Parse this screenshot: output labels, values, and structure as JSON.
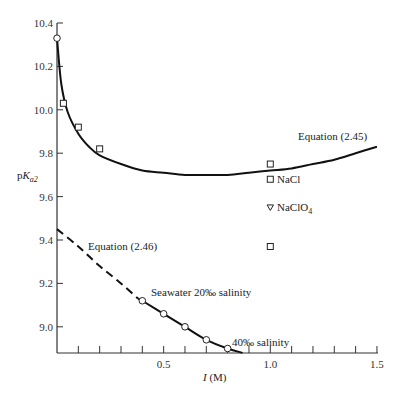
{
  "chart_data": {
    "type": "line",
    "title": "",
    "xlabel": "I (M)",
    "ylabel": "pK_a2",
    "xlim": [
      0,
      1.5
    ],
    "ylim": [
      8.88,
      10.4
    ],
    "grid": false,
    "x_ticks": [
      {
        "value": 0.5,
        "label": "0.5"
      },
      {
        "value": 1.0,
        "label": "1.0"
      },
      {
        "value": 1.5,
        "label": "1.5"
      }
    ],
    "x_minor_tick_step": 0.1,
    "y_ticks": [
      {
        "value": 10.4,
        "label": "10.4"
      },
      {
        "value": 10.2,
        "label": "10.2"
      },
      {
        "value": 10.0,
        "label": "10.0"
      },
      {
        "value": 9.8,
        "label": "9.8"
      },
      {
        "value": 9.6,
        "label": "9.6"
      },
      {
        "value": 9.4,
        "label": "9.4"
      },
      {
        "value": 9.2,
        "label": "9.2"
      },
      {
        "value": 9.0,
        "label": "9.0"
      }
    ],
    "series": [
      {
        "name": "Equation (2.45)",
        "style": "solid",
        "x": [
          0.0,
          0.02,
          0.05,
          0.1,
          0.15,
          0.2,
          0.3,
          0.4,
          0.5,
          0.6,
          0.7,
          0.8,
          0.9,
          1.0,
          1.1,
          1.2,
          1.3,
          1.4,
          1.5
        ],
        "values": [
          10.33,
          10.12,
          9.99,
          9.89,
          9.83,
          9.79,
          9.75,
          9.72,
          9.71,
          9.7,
          9.7,
          9.7,
          9.71,
          9.72,
          9.73,
          9.75,
          9.77,
          9.8,
          9.83
        ]
      },
      {
        "name": "Equation (2.46)",
        "style": "dashed",
        "x": [
          0.0,
          0.1,
          0.2,
          0.3,
          0.38
        ],
        "values": [
          9.45,
          9.37,
          9.28,
          9.2,
          9.13
        ]
      },
      {
        "name": "Seawater fit",
        "style": "solid",
        "x": [
          0.38,
          0.4,
          0.5,
          0.6,
          0.7,
          0.8,
          0.87
        ],
        "values": [
          9.13,
          9.12,
          9.06,
          9.0,
          8.94,
          8.9,
          8.88
        ]
      }
    ],
    "markers": [
      {
        "group": "open-circle",
        "points": [
          [
            0.0,
            10.33
          ]
        ]
      },
      {
        "group": "open-square",
        "points": [
          [
            0.03,
            10.03
          ],
          [
            0.1,
            9.92
          ],
          [
            0.2,
            9.82
          ],
          [
            1.0,
            9.75
          ],
          [
            1.0,
            9.68
          ],
          [
            1.0,
            9.37
          ]
        ]
      },
      {
        "group": "open-triangle-down",
        "points": [
          [
            1.0,
            9.55
          ]
        ]
      },
      {
        "group": "seawater-circle",
        "points": [
          [
            0.4,
            9.12
          ],
          [
            0.5,
            9.06
          ],
          [
            0.6,
            9.0
          ],
          [
            0.7,
            8.94
          ],
          [
            0.8,
            8.9
          ]
        ]
      }
    ],
    "annotations": [
      {
        "text": "Equation (2.45)",
        "x": 1.15,
        "y": 9.88
      },
      {
        "text": "NaCl",
        "x": 1.03,
        "y": 9.68
      },
      {
        "text": "NaClO",
        "sub": "4",
        "x": 1.03,
        "y": 9.55
      },
      {
        "text": "Equation (2.46)",
        "x": 0.14,
        "y": 9.4
      },
      {
        "text": "Seawater 20‰ salinity",
        "x": 0.43,
        "y": 9.15
      },
      {
        "text": "40‰ salinity",
        "x": 0.83,
        "y": 8.92
      }
    ]
  },
  "labels": {
    "x_axis": "I (M)",
    "x_axis_italic": "I",
    "x_axis_unit": " (M)",
    "y_axis_p": "p",
    "y_axis_K": "K",
    "y_axis_sub": "a2",
    "eq245": "Equation (2.45)",
    "eq246": "Equation (2.46)",
    "nacl": "NaCl",
    "naclo4_main": "NaClO",
    "naclo4_sub": "4",
    "seawater20": "Seawater 20‰ salinity",
    "seawater40": "40‰ salinity"
  }
}
